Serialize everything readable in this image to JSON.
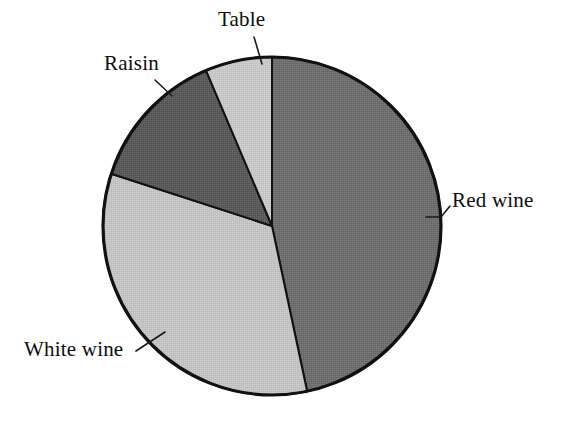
{
  "chart_data": {
    "type": "pie",
    "title": "",
    "subtitle": "",
    "xlabel": "",
    "ylabel": "",
    "legend_position": "none",
    "grid": false,
    "label_style": "leader-line callouts",
    "categories": [
      "Red wine",
      "White wine",
      "Raisin",
      "Table"
    ],
    "values": [
      46.7,
      33.3,
      13.6,
      6.4
    ],
    "unit": "percent",
    "start_angle_deg": 0,
    "direction": "clockwise",
    "slices": [
      {
        "label": "Red wine",
        "value": 46.7,
        "angle_deg": 168,
        "color": "#6f6f6f",
        "label_position": "right"
      },
      {
        "label": "White wine",
        "value": 33.3,
        "angle_deg": 120,
        "color": "#c4c4c4",
        "label_position": "bottom-left"
      },
      {
        "label": "Raisin",
        "value": 13.6,
        "angle_deg": 49,
        "color": "#5b5b5b",
        "label_position": "top-left"
      },
      {
        "label": "Table",
        "value": 6.4,
        "angle_deg": 23,
        "color": "#c8c8c8",
        "label_position": "top"
      }
    ],
    "colors": {
      "red_wine": "#6f6f6f",
      "white_wine": "#c4c4c4",
      "raisin": "#5b5b5b",
      "table": "#c8c8c8",
      "outline": "#111111",
      "background": "#ffffff",
      "text": "#0d0d0d"
    }
  },
  "labels": {
    "red_wine": "Red wine",
    "white_wine": "White wine",
    "raisin": "Raisin",
    "table": "Table"
  }
}
